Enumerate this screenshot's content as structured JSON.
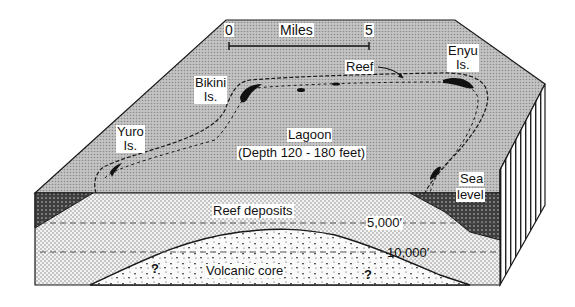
{
  "diagram": {
    "type": "block-diagram",
    "scale_bar": {
      "start_label": "0",
      "end_label": "5",
      "unit_label": "Miles"
    },
    "islands": [
      {
        "name": "Bikini",
        "suffix": "Is."
      },
      {
        "name": "Yuro",
        "suffix": "Is."
      },
      {
        "name": "Enyu",
        "suffix": "Is."
      }
    ],
    "surface_labels": {
      "reef": "Reef",
      "lagoon": "Lagoon",
      "lagoon_depth": "(Depth 120 - 180 feet)",
      "sea": "Sea",
      "level": "level"
    },
    "section_labels": {
      "reef_deposits": "Reef deposits",
      "depth_5000": "5,000′",
      "depth_10000": "10,000′",
      "volcanic_core": "Volcanic core",
      "unknown_1": "?",
      "unknown_2": "?"
    },
    "colors": {
      "ocean_surface": "#b8b8b8",
      "reef_deposits": "#e6e6e6",
      "volcanic_core": "#f4f4f4",
      "sea_water": "#5a5a5a",
      "outline": "#1a1a1a"
    }
  }
}
